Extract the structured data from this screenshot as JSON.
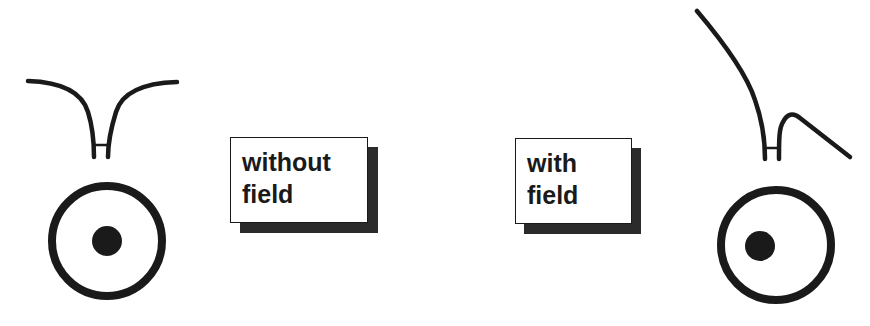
{
  "labels": {
    "without_field": "without\nfield",
    "with_field": "with\nfield"
  },
  "panels": [
    {
      "condition": "without field",
      "tip_state": "symmetric",
      "dot_position": "centered"
    },
    {
      "condition": "with field",
      "tip_state": "deflected",
      "dot_position": "offset-left"
    }
  ],
  "colors": {
    "ink": "#1a1a1a",
    "shadow": "#2b2b2b",
    "background": "#ffffff"
  }
}
